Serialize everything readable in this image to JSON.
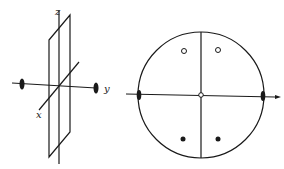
{
  "figure": {
    "left_panel": {
      "description": "3D axes with a mirror plane and two-fold axis along y",
      "axis_labels": {
        "z": "z",
        "y": "y",
        "x": "x"
      },
      "symbols": [
        "two-fold-axis-ellipse-left",
        "two-fold-axis-ellipse-right"
      ]
    },
    "right_panel": {
      "description": "Stereographic projection",
      "open_circles": 2,
      "filled_dots": 2,
      "center_marker": "small-open-circle",
      "edge_markers": [
        "two-fold-ellipse-left",
        "two-fold-ellipse-right"
      ]
    },
    "colors": {
      "ink": "#1a1a1a",
      "background": "#ffffff"
    }
  }
}
